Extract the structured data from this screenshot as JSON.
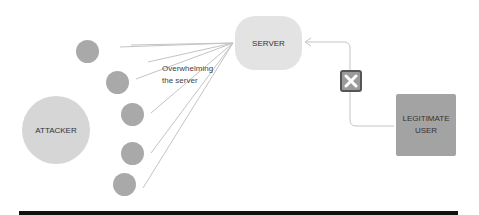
{
  "diagram": {
    "attacker": {
      "label": "ATTACKER"
    },
    "server": {
      "label": "SERVER"
    },
    "legitimate_user": {
      "label_line1": "LEGITIMATE",
      "label_line2": "USER"
    },
    "annotation": {
      "line1": "Overwhelming",
      "line2": "the server"
    },
    "bots": [
      {
        "x": 87,
        "y": 51
      },
      {
        "x": 117,
        "y": 82
      },
      {
        "x": 132,
        "y": 114
      },
      {
        "x": 132,
        "y": 153
      },
      {
        "x": 124,
        "y": 184
      }
    ],
    "blocked_icon": "x-mark-icon",
    "colors": {
      "bot": "#a9a9a9",
      "attacker": "#d6d6d6",
      "server": "#e3e3e3",
      "legit": "#a3a3a3",
      "bar": "#111111"
    }
  }
}
